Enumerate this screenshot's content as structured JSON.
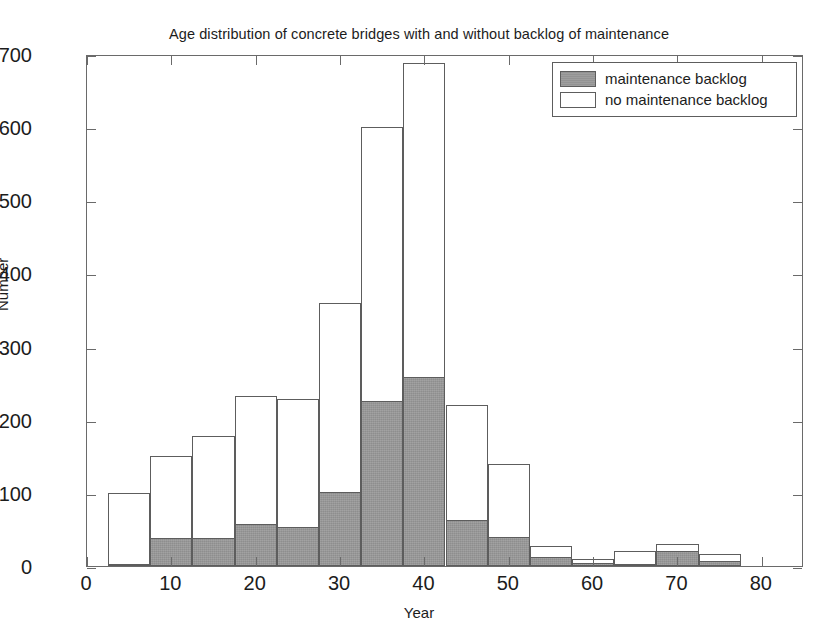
{
  "chart_data": {
    "type": "bar",
    "title": "Age distribution of concrete bridges with and without backlog of maintenance",
    "xlabel": "Year",
    "ylabel": "Number",
    "xlim": [
      0,
      85
    ],
    "ylim": [
      0,
      700
    ],
    "grid": false,
    "stacked": true,
    "bin_width": 5,
    "legend_position": "top-right",
    "x_ticks": [
      0,
      10,
      20,
      30,
      40,
      50,
      60,
      70,
      80
    ],
    "x_tick_labels": [
      "0",
      "10",
      "20",
      "30",
      "40",
      "50",
      "60",
      "70",
      "80"
    ],
    "y_ticks": [
      0,
      100,
      200,
      300,
      400,
      500,
      600,
      700
    ],
    "y_tick_labels": [
      "0",
      "100",
      "200",
      "300",
      "400",
      "500",
      "600",
      "700"
    ],
    "bin_centers": [
      5,
      10,
      15,
      20,
      25,
      30,
      35,
      40,
      45,
      50,
      55,
      60,
      65,
      70,
      75
    ],
    "bin_starts": [
      2.5,
      7.5,
      12.5,
      17.5,
      22.5,
      27.5,
      32.5,
      37.5,
      42.5,
      47.5,
      52.5,
      57.5,
      62.5,
      67.5,
      72.5
    ],
    "series": [
      {
        "name": "maintenance backlog",
        "color": "#999999",
        "values": [
          3,
          38,
          38,
          58,
          54,
          101,
          225,
          258,
          63,
          39,
          12,
          4,
          2,
          21,
          7
        ]
      },
      {
        "name": "no maintenance backlog",
        "color": "#ffffff",
        "values": [
          97,
          112,
          140,
          174,
          175,
          259,
          375,
          430,
          157,
          101,
          16,
          5,
          19,
          9,
          9
        ]
      }
    ],
    "totals": [
      100,
      150,
      178,
      232,
      229,
      360,
      600,
      688,
      220,
      140,
      28,
      9,
      21,
      30,
      16
    ]
  },
  "legend": {
    "items": [
      {
        "label": "maintenance backlog",
        "swatch": "filled-square-icon"
      },
      {
        "label": "no maintenance backlog",
        "swatch": "hollow-square-icon"
      }
    ]
  },
  "caption_sliver": ""
}
